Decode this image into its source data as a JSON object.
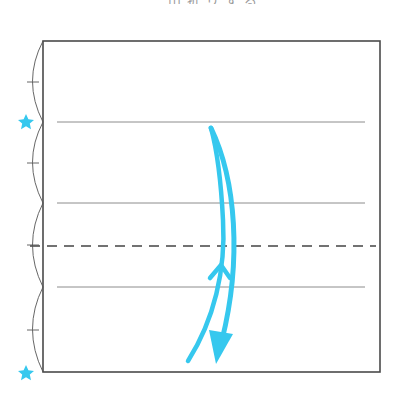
{
  "diagram": {
    "type": "origami-fold-instruction",
    "clipped_title": "山折りする",
    "colors": {
      "paper_edge": "#4a4a4a",
      "guide_line": "#8c8c8c",
      "fold_line": "#444444",
      "accent": "#36C8EE",
      "background": "#ffffff"
    },
    "paper": {
      "x": 43,
      "y": 41,
      "width": 337,
      "height": 331
    },
    "crease_lines": [
      {
        "kind": "solid",
        "y": 122,
        "x1": 57,
        "x2": 365
      },
      {
        "kind": "solid",
        "y": 203,
        "x1": 57,
        "x2": 365
      },
      {
        "kind": "dashed",
        "label": "valley-fold",
        "y": 246,
        "x1": 30,
        "x2": 376
      },
      {
        "kind": "solid",
        "y": 287,
        "x1": 57,
        "x2": 365
      }
    ],
    "division_arcs": [
      {
        "y1": 41,
        "y2": 122
      },
      {
        "y1": 122,
        "y2": 203
      },
      {
        "y1": 203,
        "y2": 287
      },
      {
        "y1": 287,
        "y2": 372
      }
    ],
    "markers": [
      {
        "shape": "star",
        "x": 26,
        "y": 122
      },
      {
        "shape": "star",
        "x": 26,
        "y": 373
      }
    ],
    "arrows": [
      {
        "name": "fold-up-arrow",
        "description": "thin line with chevron pointing up"
      },
      {
        "name": "fold-down-arrow",
        "description": "curved arrow with filled arrowhead pointing down"
      }
    ]
  }
}
